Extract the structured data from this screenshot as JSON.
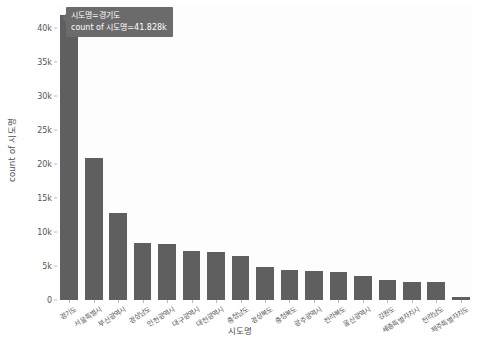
{
  "chart_data": {
    "type": "bar",
    "title": "",
    "xlabel": "시도명",
    "ylabel": "count of 시도명",
    "ylim": [
      0,
      43500
    ],
    "grid": false,
    "legend": null,
    "ytick_labels": [
      "0",
      "5k",
      "10k",
      "15k",
      "20k",
      "25k",
      "30k",
      "35k",
      "40k"
    ],
    "ytick_values": [
      0,
      5000,
      10000,
      15000,
      20000,
      25000,
      30000,
      35000,
      40000
    ],
    "categories": [
      "경기도",
      "서울특별시",
      "부산광역시",
      "경상남도",
      "인천광역시",
      "대구광역시",
      "대전광역시",
      "충청남도",
      "경상북도",
      "충청북도",
      "광주광역시",
      "전라북도",
      "울산광역시",
      "강원도",
      "세종특별자치시",
      "전라남도",
      "제주특별자치도"
    ],
    "values": [
      41828,
      20800,
      12800,
      8400,
      8300,
      7200,
      7000,
      6500,
      4900,
      4400,
      4200,
      4150,
      3600,
      2900,
      2700,
      2650,
      500
    ],
    "bar_color": "#5f5f5f",
    "plot_background": "#fdfdfd"
  },
  "tooltip": {
    "line1": "시도명=경기도",
    "line2": "count of 시도명=41.828k",
    "background": "#6b6b6b",
    "text_color": "#ffffff"
  }
}
